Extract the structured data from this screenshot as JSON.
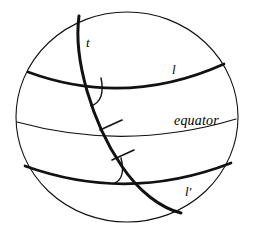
{
  "figure": {
    "type": "spherical-geometry-diagram",
    "background_color": "#ffffff",
    "ink_color": "#000000",
    "canvas": {
      "width": 256,
      "height": 240
    }
  },
  "labels": {
    "transversal": "t",
    "line_upper": "l",
    "line_lower": "l'",
    "equator": "equator"
  },
  "geometry": {
    "sphere_outline": {
      "center_x": 127,
      "center_y": 117,
      "radius_x": 111,
      "radius_y": 105,
      "stroke_width": 1.1
    },
    "curves": [
      {
        "name": "line-l",
        "label": "l",
        "kind": "thick-latitude-arc",
        "stroke_width": 2.6,
        "path": "M 28,72 Q 126,108 224,64"
      },
      {
        "name": "equator",
        "label": "equator",
        "kind": "thin-latitude-arc",
        "stroke_width": 1.1,
        "path": "M 17,122 Q 126,152 236,119"
      },
      {
        "name": "line-l-prime",
        "label": "l'",
        "kind": "thick-latitude-arc",
        "stroke_width": 2.6,
        "path": "M 25,166 Q 128,203 231,163"
      },
      {
        "name": "transversal-t",
        "label": "t",
        "kind": "thick-great-circle-arc",
        "stroke_width": 2.8,
        "path": "M 79,16 C 74,62 96,128 124,168 C 142,194 162,209 181,213"
      }
    ],
    "angle_arcs": [
      {
        "name": "angle-at-l",
        "at_x": 102,
        "at_y": 92,
        "note": "interior angle between t and l"
      },
      {
        "name": "angle-at-l-prime",
        "at_x": 122,
        "at_y": 166,
        "note": "corresponding angle between t and l'"
      }
    ],
    "tick_marks": [
      {
        "name": "congruence-tick-upper",
        "at_x": 110,
        "at_y": 127,
        "count": 1
      },
      {
        "name": "congruence-tick-lower",
        "at_x": 122,
        "at_y": 156,
        "count": 1
      }
    ]
  }
}
